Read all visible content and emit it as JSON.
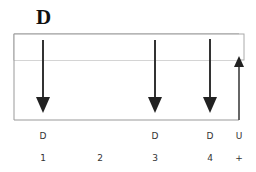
{
  "title": "D",
  "arrows": [
    {
      "x": 43,
      "direction": "down",
      "label": "D",
      "number": "1"
    },
    {
      "x": 155,
      "direction": "down",
      "label": "D",
      "number": "3"
    },
    {
      "x": 210,
      "direction": "down",
      "label": "D",
      "number": "4"
    },
    {
      "x": 239,
      "direction": "up",
      "label": "U",
      "number": "+"
    }
  ],
  "labels_row": [
    "D",
    "",
    "D",
    "D",
    "U"
  ],
  "numbers_row": [
    "1",
    "2",
    "3",
    "4",
    "+"
  ],
  "colors": {
    "box": "#999999",
    "arrow": "#333333"
  }
}
